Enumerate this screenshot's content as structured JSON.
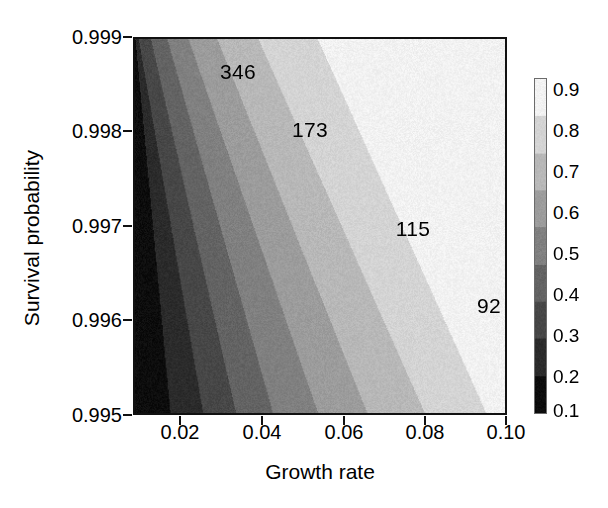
{
  "chart_data": {
    "type": "heatmap",
    "title": "",
    "xlabel": "Growth rate",
    "ylabel": "Survival probability",
    "xlim": [
      0.01,
      0.1
    ],
    "ylim": [
      0.995,
      0.999
    ],
    "xticks": [
      0.02,
      0.04,
      0.06,
      0.08,
      0.1
    ],
    "xtick_labels": [
      "0.02",
      "0.04",
      "0.06",
      "0.08",
      "0.10"
    ],
    "yticks": [
      0.995,
      0.996,
      0.997,
      0.998,
      0.999
    ],
    "ytick_labels": [
      "0.995",
      "0.996",
      "0.997",
      "0.998",
      "0.999"
    ],
    "grid": false,
    "colormap": "grayscale",
    "colorbar": {
      "position": "right",
      "orientation": "vertical",
      "min": 0.05,
      "max": 0.95,
      "ticks": [
        0.9,
        0.8,
        0.7,
        0.6,
        0.5,
        0.4,
        0.3,
        0.2,
        0.1
      ],
      "tick_labels": [
        "0.9",
        "0.8",
        "0.7",
        "0.6",
        "0.5",
        "0.4",
        "0.3",
        "0.2",
        "0.1"
      ],
      "band_levels": [
        0.1,
        0.2,
        0.3,
        0.4,
        0.5,
        0.6,
        0.7,
        0.8,
        0.9
      ],
      "band_grays": [
        "#0d0d0d",
        "#2b2b2b",
        "#474747",
        "#636363",
        "#808080",
        "#9c9c9c",
        "#b8b8b8",
        "#d4d4d4",
        "#f2f2f2"
      ]
    },
    "z_description": "Probability of persistence; increases from lower-left (low growth rate, low survival) to upper-right (high growth rate, high survival), with diagonal contour bands.",
    "band_grays": [
      "#0d0d0d",
      "#2b2b2b",
      "#474747",
      "#636363",
      "#808080",
      "#9c9c9c",
      "#b8b8b8",
      "#d4d4d4",
      "#f2f2f2"
    ],
    "band_boundaries_x_at_ymin": [
      0.0185,
      0.0265,
      0.0345,
      0.0435,
      0.0545,
      0.0665,
      0.0805,
      0.0955
    ],
    "band_boundaries_x_at_ymax": [
      0.01,
      0.0108,
      0.0138,
      0.0178,
      0.023,
      0.03,
      0.04,
      0.0545
    ],
    "contour_labels": [
      {
        "text": "346",
        "x": 0.0365,
        "y": 0.99863
      },
      {
        "text": "173",
        "x": 0.054,
        "y": 0.99803
      },
      {
        "text": "115",
        "x": 0.079,
        "y": 0.99699
      },
      {
        "text": "92",
        "x": 0.0975,
        "y": 0.9963
      }
    ]
  },
  "axes": {
    "y_label": "Survival probability",
    "x_label": "Growth rate",
    "y_tick_labels": [
      "0.999",
      "0.998",
      "0.997",
      "0.996",
      "0.995"
    ],
    "x_tick_labels": [
      "0.02",
      "0.04",
      "0.06",
      "0.08",
      "0.10"
    ]
  },
  "colorbar_tick_labels": [
    "0.9",
    "0.8",
    "0.7",
    "0.6",
    "0.5",
    "0.4",
    "0.3",
    "0.2",
    "0.1"
  ],
  "contour_label_texts": [
    "346",
    "173",
    "115",
    "92"
  ]
}
